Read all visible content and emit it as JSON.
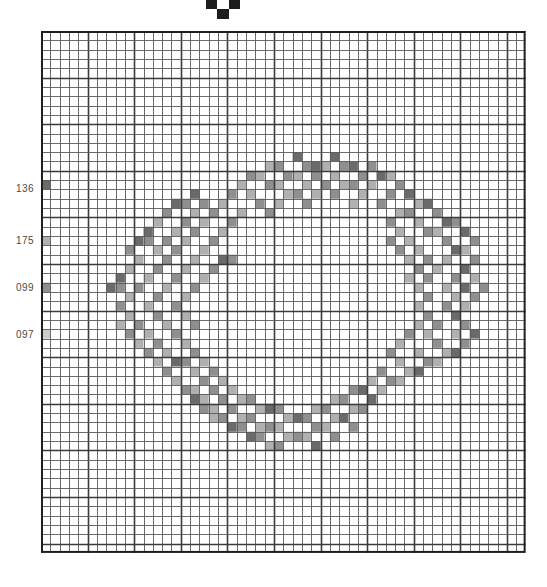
{
  "document": {
    "title": "Cross-Stitch Wreath Pattern Chart",
    "kind": "needlework-chart"
  },
  "center_marker": {
    "name": "center-marker",
    "shape": "inverted-triangle-stepped",
    "color": "#1d1d1d",
    "label": ""
  },
  "grid": {
    "origin_x": 41,
    "origin_y": 31,
    "cols": 52,
    "rows": 56,
    "cell": 9.32,
    "line_color": "#3b3b3b",
    "thin_line_color": "#5a5a5a",
    "bold_every": 5,
    "background": "#ffffff",
    "border_color": "#1f1f1f"
  },
  "legend": {
    "title": "",
    "items": [
      {
        "code": "136",
        "swatch": "#6e6e6e",
        "y": 188,
        "cell_row": 16
      },
      {
        "code": "175",
        "swatch": "#9a9a9a",
        "y": 240,
        "cell_row": 22
      },
      {
        "code": "099",
        "swatch": "#8a8a8a",
        "y": 287,
        "cell_row": 27
      },
      {
        "code": "097",
        "swatch": "#b5b5b5",
        "y": 334,
        "cell_row": 32
      }
    ]
  },
  "palette": {
    "dark": "#6a6a6a",
    "mid": "#8f8f8f",
    "light": "#b0b0b0",
    "pale": "#cccccc",
    "empty": "#ffffff"
  },
  "chart_data": {
    "type": "heatmap",
    "title": "Cross-Stitch Wreath Pattern Chart",
    "subtitle": "",
    "xlabel": "",
    "ylabel": "",
    "grid": true,
    "legend_position": "left",
    "categories": [],
    "x": [],
    "cols": 52,
    "rows": 56,
    "symbol_codes": [
      "136",
      "175",
      "099",
      "097"
    ],
    "symbol_colors": {
      "136": "#6a6a6a",
      "175": "#b0b0b0",
      "099": "#8f8f8f",
      "097": "#cccccc"
    },
    "legend_swatch_cells": [
      {
        "code": "136",
        "col": 0,
        "row": 16
      },
      {
        "code": "175",
        "col": 0,
        "row": 22
      },
      {
        "code": "099",
        "col": 0,
        "row": 27
      },
      {
        "code": "097",
        "col": 0,
        "row": 32
      }
    ],
    "stitches": [
      {
        "c": 27,
        "r": 13,
        "s": "136"
      },
      {
        "c": 31,
        "r": 13,
        "s": "136"
      },
      {
        "c": 24,
        "r": 14,
        "s": "175"
      },
      {
        "c": 25,
        "r": 14,
        "s": "099"
      },
      {
        "c": 28,
        "r": 14,
        "s": "099"
      },
      {
        "c": 29,
        "r": 14,
        "s": "136"
      },
      {
        "c": 30,
        "r": 14,
        "s": "175"
      },
      {
        "c": 32,
        "r": 14,
        "s": "099"
      },
      {
        "c": 33,
        "r": 14,
        "s": "136"
      },
      {
        "c": 35,
        "r": 14,
        "s": "099"
      },
      {
        "c": 22,
        "r": 15,
        "s": "099"
      },
      {
        "c": 23,
        "r": 15,
        "s": "175"
      },
      {
        "c": 26,
        "r": 15,
        "s": "099"
      },
      {
        "c": 27,
        "r": 15,
        "s": "175"
      },
      {
        "c": 29,
        "r": 15,
        "s": "099"
      },
      {
        "c": 31,
        "r": 15,
        "s": "175"
      },
      {
        "c": 34,
        "r": 15,
        "s": "099"
      },
      {
        "c": 36,
        "r": 15,
        "s": "136"
      },
      {
        "c": 37,
        "r": 15,
        "s": "175"
      },
      {
        "c": 21,
        "r": 16,
        "s": "175"
      },
      {
        "c": 24,
        "r": 16,
        "s": "099"
      },
      {
        "c": 25,
        "r": 16,
        "s": "175"
      },
      {
        "c": 28,
        "r": 16,
        "s": "175"
      },
      {
        "c": 30,
        "r": 16,
        "s": "099"
      },
      {
        "c": 32,
        "r": 16,
        "s": "175"
      },
      {
        "c": 33,
        "r": 16,
        "s": "099"
      },
      {
        "c": 35,
        "r": 16,
        "s": "175"
      },
      {
        "c": 38,
        "r": 16,
        "s": "099"
      },
      {
        "c": 16,
        "r": 17,
        "s": "136"
      },
      {
        "c": 20,
        "r": 17,
        "s": "099"
      },
      {
        "c": 22,
        "r": 17,
        "s": "175"
      },
      {
        "c": 26,
        "r": 17,
        "s": "175"
      },
      {
        "c": 27,
        "r": 17,
        "s": "099"
      },
      {
        "c": 29,
        "r": 17,
        "s": "175"
      },
      {
        "c": 31,
        "r": 17,
        "s": "099"
      },
      {
        "c": 34,
        "r": 17,
        "s": "175"
      },
      {
        "c": 37,
        "r": 17,
        "s": "099"
      },
      {
        "c": 39,
        "r": 17,
        "s": "136"
      },
      {
        "c": 14,
        "r": 18,
        "s": "136"
      },
      {
        "c": 15,
        "r": 18,
        "s": "099"
      },
      {
        "c": 17,
        "r": 18,
        "s": "099"
      },
      {
        "c": 19,
        "r": 18,
        "s": "175"
      },
      {
        "c": 23,
        "r": 18,
        "s": "099"
      },
      {
        "c": 25,
        "r": 18,
        "s": "175"
      },
      {
        "c": 28,
        "r": 18,
        "s": "099"
      },
      {
        "c": 33,
        "r": 18,
        "s": "175"
      },
      {
        "c": 36,
        "r": 18,
        "s": "099"
      },
      {
        "c": 40,
        "r": 18,
        "s": "175"
      },
      {
        "c": 41,
        "r": 18,
        "s": "136"
      },
      {
        "c": 13,
        "r": 19,
        "s": "099"
      },
      {
        "c": 16,
        "r": 19,
        "s": "175"
      },
      {
        "c": 18,
        "r": 19,
        "s": "099"
      },
      {
        "c": 21,
        "r": 19,
        "s": "175"
      },
      {
        "c": 24,
        "r": 19,
        "s": "099"
      },
      {
        "c": 38,
        "r": 19,
        "s": "175"
      },
      {
        "c": 39,
        "r": 19,
        "s": "099"
      },
      {
        "c": 42,
        "r": 19,
        "s": "099"
      },
      {
        "c": 12,
        "r": 20,
        "s": "175"
      },
      {
        "c": 15,
        "r": 20,
        "s": "099"
      },
      {
        "c": 17,
        "r": 20,
        "s": "175"
      },
      {
        "c": 20,
        "r": 20,
        "s": "099"
      },
      {
        "c": 37,
        "r": 20,
        "s": "099"
      },
      {
        "c": 40,
        "r": 20,
        "s": "175"
      },
      {
        "c": 43,
        "r": 20,
        "s": "136"
      },
      {
        "c": 44,
        "r": 20,
        "s": "099"
      },
      {
        "c": 11,
        "r": 21,
        "s": "136"
      },
      {
        "c": 14,
        "r": 21,
        "s": "175"
      },
      {
        "c": 16,
        "r": 21,
        "s": "099"
      },
      {
        "c": 19,
        "r": 21,
        "s": "175"
      },
      {
        "c": 38,
        "r": 21,
        "s": "175"
      },
      {
        "c": 41,
        "r": 21,
        "s": "099"
      },
      {
        "c": 42,
        "r": 21,
        "s": "175"
      },
      {
        "c": 45,
        "r": 21,
        "s": "136"
      },
      {
        "c": 10,
        "r": 22,
        "s": "136"
      },
      {
        "c": 11,
        "r": 22,
        "s": "099"
      },
      {
        "c": 13,
        "r": 22,
        "s": "099"
      },
      {
        "c": 15,
        "r": 22,
        "s": "175"
      },
      {
        "c": 18,
        "r": 22,
        "s": "099"
      },
      {
        "c": 37,
        "r": 22,
        "s": "099"
      },
      {
        "c": 39,
        "r": 22,
        "s": "175"
      },
      {
        "c": 43,
        "r": 22,
        "s": "099"
      },
      {
        "c": 46,
        "r": 22,
        "s": "099"
      },
      {
        "c": 9,
        "r": 23,
        "s": "099"
      },
      {
        "c": 12,
        "r": 23,
        "s": "175"
      },
      {
        "c": 14,
        "r": 23,
        "s": "099"
      },
      {
        "c": 17,
        "r": 23,
        "s": "175"
      },
      {
        "c": 38,
        "r": 23,
        "s": "099"
      },
      {
        "c": 40,
        "r": 23,
        "s": "175"
      },
      {
        "c": 44,
        "r": 23,
        "s": "136"
      },
      {
        "c": 45,
        "r": 23,
        "s": "175"
      },
      {
        "c": 10,
        "r": 24,
        "s": "175"
      },
      {
        "c": 13,
        "r": 24,
        "s": "099"
      },
      {
        "c": 16,
        "r": 24,
        "s": "175"
      },
      {
        "c": 19,
        "r": 24,
        "s": "136"
      },
      {
        "c": 20,
        "r": 24,
        "s": "099"
      },
      {
        "c": 39,
        "r": 24,
        "s": "175"
      },
      {
        "c": 41,
        "r": 24,
        "s": "099"
      },
      {
        "c": 43,
        "r": 24,
        "s": "175"
      },
      {
        "c": 46,
        "r": 24,
        "s": "099"
      },
      {
        "c": 9,
        "r": 25,
        "s": "175"
      },
      {
        "c": 12,
        "r": 25,
        "s": "099"
      },
      {
        "c": 15,
        "r": 25,
        "s": "175"
      },
      {
        "c": 18,
        "r": 25,
        "s": "099"
      },
      {
        "c": 40,
        "r": 25,
        "s": "099"
      },
      {
        "c": 42,
        "r": 25,
        "s": "175"
      },
      {
        "c": 45,
        "r": 25,
        "s": "136"
      },
      {
        "c": 8,
        "r": 26,
        "s": "136"
      },
      {
        "c": 11,
        "r": 26,
        "s": "175"
      },
      {
        "c": 14,
        "r": 26,
        "s": "099"
      },
      {
        "c": 17,
        "r": 26,
        "s": "175"
      },
      {
        "c": 39,
        "r": 26,
        "s": "175"
      },
      {
        "c": 41,
        "r": 26,
        "s": "099"
      },
      {
        "c": 44,
        "r": 26,
        "s": "099"
      },
      {
        "c": 46,
        "r": 26,
        "s": "175"
      },
      {
        "c": 7,
        "r": 27,
        "s": "136"
      },
      {
        "c": 8,
        "r": 27,
        "s": "099"
      },
      {
        "c": 10,
        "r": 27,
        "s": "099"
      },
      {
        "c": 13,
        "r": 27,
        "s": "175"
      },
      {
        "c": 16,
        "r": 27,
        "s": "099"
      },
      {
        "c": 40,
        "r": 27,
        "s": "175"
      },
      {
        "c": 43,
        "r": 27,
        "s": "175"
      },
      {
        "c": 45,
        "r": 27,
        "s": "136"
      },
      {
        "c": 47,
        "r": 27,
        "s": "099"
      },
      {
        "c": 9,
        "r": 28,
        "s": "175"
      },
      {
        "c": 12,
        "r": 28,
        "s": "099"
      },
      {
        "c": 15,
        "r": 28,
        "s": "175"
      },
      {
        "c": 41,
        "r": 28,
        "s": "099"
      },
      {
        "c": 44,
        "r": 28,
        "s": "175"
      },
      {
        "c": 46,
        "r": 28,
        "s": "099"
      },
      {
        "c": 8,
        "r": 29,
        "s": "099"
      },
      {
        "c": 11,
        "r": 29,
        "s": "175"
      },
      {
        "c": 14,
        "r": 29,
        "s": "099"
      },
      {
        "c": 40,
        "r": 29,
        "s": "175"
      },
      {
        "c": 43,
        "r": 29,
        "s": "099"
      },
      {
        "c": 45,
        "r": 29,
        "s": "175"
      },
      {
        "c": 9,
        "r": 30,
        "s": "175"
      },
      {
        "c": 12,
        "r": 30,
        "s": "099"
      },
      {
        "c": 15,
        "r": 30,
        "s": "175"
      },
      {
        "c": 41,
        "r": 30,
        "s": "099"
      },
      {
        "c": 44,
        "r": 30,
        "s": "136"
      },
      {
        "c": 8,
        "r": 31,
        "s": "175"
      },
      {
        "c": 10,
        "r": 31,
        "s": "099"
      },
      {
        "c": 13,
        "r": 31,
        "s": "175"
      },
      {
        "c": 16,
        "r": 31,
        "s": "099"
      },
      {
        "c": 40,
        "r": 31,
        "s": "175"
      },
      {
        "c": 42,
        "r": 31,
        "s": "099"
      },
      {
        "c": 45,
        "r": 31,
        "s": "099"
      },
      {
        "c": 9,
        "r": 32,
        "s": "099"
      },
      {
        "c": 11,
        "r": 32,
        "s": "175"
      },
      {
        "c": 14,
        "r": 32,
        "s": "099"
      },
      {
        "c": 39,
        "r": 32,
        "s": "099"
      },
      {
        "c": 41,
        "r": 32,
        "s": "175"
      },
      {
        "c": 44,
        "r": 32,
        "s": "175"
      },
      {
        "c": 46,
        "r": 32,
        "s": "136"
      },
      {
        "c": 10,
        "r": 33,
        "s": "175"
      },
      {
        "c": 12,
        "r": 33,
        "s": "099"
      },
      {
        "c": 15,
        "r": 33,
        "s": "175"
      },
      {
        "c": 38,
        "r": 33,
        "s": "175"
      },
      {
        "c": 42,
        "r": 33,
        "s": "099"
      },
      {
        "c": 45,
        "r": 33,
        "s": "099"
      },
      {
        "c": 11,
        "r": 34,
        "s": "099"
      },
      {
        "c": 13,
        "r": 34,
        "s": "175"
      },
      {
        "c": 16,
        "r": 34,
        "s": "099"
      },
      {
        "c": 37,
        "r": 34,
        "s": "099"
      },
      {
        "c": 40,
        "r": 34,
        "s": "175"
      },
      {
        "c": 43,
        "r": 34,
        "s": "175"
      },
      {
        "c": 44,
        "r": 34,
        "s": "136"
      },
      {
        "c": 12,
        "r": 35,
        "s": "175"
      },
      {
        "c": 14,
        "r": 35,
        "s": "136"
      },
      {
        "c": 15,
        "r": 35,
        "s": "099"
      },
      {
        "c": 17,
        "r": 35,
        "s": "175"
      },
      {
        "c": 38,
        "r": 35,
        "s": "175"
      },
      {
        "c": 41,
        "r": 35,
        "s": "099"
      },
      {
        "c": 42,
        "r": 35,
        "s": "175"
      },
      {
        "c": 13,
        "r": 36,
        "s": "099"
      },
      {
        "c": 16,
        "r": 36,
        "s": "175"
      },
      {
        "c": 18,
        "r": 36,
        "s": "099"
      },
      {
        "c": 36,
        "r": 36,
        "s": "099"
      },
      {
        "c": 39,
        "r": 36,
        "s": "175"
      },
      {
        "c": 40,
        "r": 36,
        "s": "136"
      },
      {
        "c": 14,
        "r": 37,
        "s": "175"
      },
      {
        "c": 17,
        "r": 37,
        "s": "099"
      },
      {
        "c": 19,
        "r": 37,
        "s": "175"
      },
      {
        "c": 35,
        "r": 37,
        "s": "175"
      },
      {
        "c": 37,
        "r": 37,
        "s": "099"
      },
      {
        "c": 38,
        "r": 37,
        "s": "175"
      },
      {
        "c": 15,
        "r": 38,
        "s": "099"
      },
      {
        "c": 16,
        "r": 38,
        "s": "175"
      },
      {
        "c": 18,
        "r": 38,
        "s": "099"
      },
      {
        "c": 20,
        "r": 38,
        "s": "175"
      },
      {
        "c": 33,
        "r": 38,
        "s": "099"
      },
      {
        "c": 34,
        "r": 38,
        "s": "136"
      },
      {
        "c": 36,
        "r": 38,
        "s": "175"
      },
      {
        "c": 16,
        "r": 39,
        "s": "136"
      },
      {
        "c": 17,
        "r": 39,
        "s": "175"
      },
      {
        "c": 19,
        "r": 39,
        "s": "099"
      },
      {
        "c": 21,
        "r": 39,
        "s": "175"
      },
      {
        "c": 22,
        "r": 39,
        "s": "099"
      },
      {
        "c": 31,
        "r": 39,
        "s": "175"
      },
      {
        "c": 32,
        "r": 39,
        "s": "099"
      },
      {
        "c": 35,
        "r": 39,
        "s": "136"
      },
      {
        "c": 17,
        "r": 40,
        "s": "099"
      },
      {
        "c": 18,
        "r": 40,
        "s": "175"
      },
      {
        "c": 20,
        "r": 40,
        "s": "099"
      },
      {
        "c": 23,
        "r": 40,
        "s": "175"
      },
      {
        "c": 24,
        "r": 40,
        "s": "136"
      },
      {
        "c": 25,
        "r": 40,
        "s": "099"
      },
      {
        "c": 29,
        "r": 40,
        "s": "175"
      },
      {
        "c": 30,
        "r": 40,
        "s": "099"
      },
      {
        "c": 33,
        "r": 40,
        "s": "175"
      },
      {
        "c": 34,
        "r": 40,
        "s": "099"
      },
      {
        "c": 18,
        "r": 41,
        "s": "175"
      },
      {
        "c": 19,
        "r": 41,
        "s": "099"
      },
      {
        "c": 21,
        "r": 41,
        "s": "175"
      },
      {
        "c": 22,
        "r": 41,
        "s": "099"
      },
      {
        "c": 26,
        "r": 41,
        "s": "175"
      },
      {
        "c": 27,
        "r": 41,
        "s": "136"
      },
      {
        "c": 28,
        "r": 41,
        "s": "099"
      },
      {
        "c": 31,
        "r": 41,
        "s": "175"
      },
      {
        "c": 32,
        "r": 41,
        "s": "136"
      },
      {
        "c": 20,
        "r": 42,
        "s": "136"
      },
      {
        "c": 21,
        "r": 42,
        "s": "099"
      },
      {
        "c": 23,
        "r": 42,
        "s": "175"
      },
      {
        "c": 24,
        "r": 42,
        "s": "099"
      },
      {
        "c": 25,
        "r": 42,
        "s": "175"
      },
      {
        "c": 29,
        "r": 42,
        "s": "099"
      },
      {
        "c": 30,
        "r": 42,
        "s": "175"
      },
      {
        "c": 33,
        "r": 42,
        "s": "099"
      },
      {
        "c": 22,
        "r": 43,
        "s": "136"
      },
      {
        "c": 23,
        "r": 43,
        "s": "099"
      },
      {
        "c": 26,
        "r": 43,
        "s": "175"
      },
      {
        "c": 27,
        "r": 43,
        "s": "099"
      },
      {
        "c": 28,
        "r": 43,
        "s": "175"
      },
      {
        "c": 31,
        "r": 43,
        "s": "099"
      },
      {
        "c": 24,
        "r": 44,
        "s": "175"
      },
      {
        "c": 25,
        "r": 44,
        "s": "099"
      },
      {
        "c": 29,
        "r": 44,
        "s": "136"
      }
    ]
  }
}
